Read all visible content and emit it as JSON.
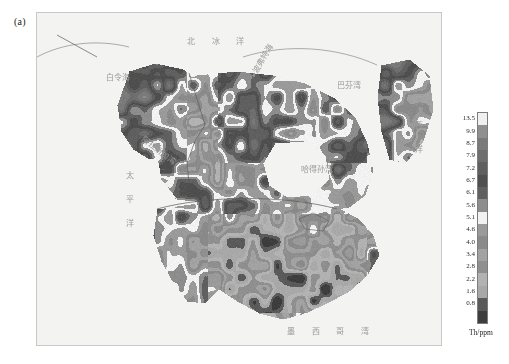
{
  "figure": {
    "panel_label": "(a)"
  },
  "map": {
    "labels": [
      {
        "id": "arctic-ocean",
        "text": "北 冰 洋",
        "left": 150,
        "top": 22,
        "style": "spaced"
      },
      {
        "id": "bering-sea",
        "text": "白令海",
        "left": 69,
        "top": 58,
        "style": "plain"
      },
      {
        "id": "beaufort-sea",
        "text": "波弗特海",
        "left": 212,
        "top": 56,
        "style": "rot",
        "rotate": -58
      },
      {
        "id": "baffin-bay",
        "text": "巴芬湾",
        "left": 300,
        "top": 66,
        "style": "plain"
      },
      {
        "id": "gulf-of-alaska",
        "text": "阿拉斯加湾",
        "left": 110,
        "top": 120,
        "style": "rot",
        "rotate": 38
      },
      {
        "id": "hudson-bay",
        "text": "哈得孙湾",
        "left": 264,
        "top": 150,
        "style": "plain"
      },
      {
        "id": "pacific-ocean",
        "text": "太平洋",
        "left": 86,
        "top": 158,
        "style": "vert"
      },
      {
        "id": "atlantic-ocean",
        "text": "大西洋",
        "left": 408,
        "top": 84,
        "style": "vert"
      },
      {
        "id": "gulf-of-mexico",
        "text": "墨 西 哥 湾",
        "left": 276,
        "top": 316,
        "style": "plain"
      }
    ]
  },
  "chart_data": {
    "type": "heatmap",
    "title": "",
    "subtitle": "",
    "xlabel": "",
    "ylabel": "",
    "unit_label": "Th/ppm",
    "variable": "Th",
    "units": "ppm",
    "region": "North America",
    "colormap": "grayscale-discrete",
    "legend_position": "right",
    "grid": false,
    "tick_labels": [
      "13.5",
      "9.9",
      "8.7",
      "7.9",
      "7.2",
      "6.7",
      "6.1",
      "5.6",
      "5.1",
      "4.6",
      "4.0",
      "3.4",
      "2.8",
      "2.2",
      "1.6",
      "0.8"
    ],
    "tick_values": [
      13.5,
      9.9,
      8.7,
      7.9,
      7.2,
      6.7,
      6.1,
      5.6,
      5.1,
      4.6,
      4.0,
      3.4,
      2.8,
      2.2,
      1.6,
      0.8
    ],
    "class_colors": [
      "#f0f0f0",
      "#8f8f8f",
      "#7a7a7a",
      "#6e6e6e",
      "#5f5f5f",
      "#4f4f4f",
      "#606060",
      "#8d8d8d",
      "#f2f2f2",
      "#9a9a9a",
      "#8a8a8a",
      "#a2a2a2",
      "#8f8f8f",
      "#b2b2b2",
      "#a8a8a8",
      "#5a5a5a",
      "#3d3d3d"
    ],
    "zlim": [
      0.8,
      13.5
    ]
  }
}
